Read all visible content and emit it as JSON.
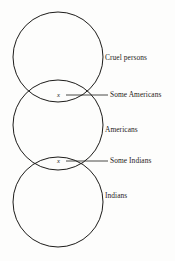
{
  "diagram": {
    "background_color": "#fdfdfc",
    "stroke_color": "#1d1c1a",
    "circles": [
      {
        "id": "cruel-persons",
        "label": "Cruel persons",
        "cx": 58,
        "cy": 57,
        "r": 45
      },
      {
        "id": "americans",
        "label": "Americans",
        "cx": 58,
        "cy": 125,
        "r": 45
      },
      {
        "id": "indians",
        "label": "Indians",
        "cx": 58,
        "cy": 202,
        "r": 45
      }
    ],
    "intersections": [
      {
        "id": "some-americans",
        "label": "Some Americans",
        "marker": "x",
        "marker_x": 59,
        "marker_y": 95,
        "leader_from_x": 66,
        "leader_to_x": 108,
        "leader_y": 95
      },
      {
        "id": "some-indians",
        "label": "Some Indians",
        "marker": "x",
        "marker_x": 59,
        "marker_y": 161,
        "leader_from_x": 66,
        "leader_to_x": 108,
        "leader_y": 161
      }
    ]
  }
}
